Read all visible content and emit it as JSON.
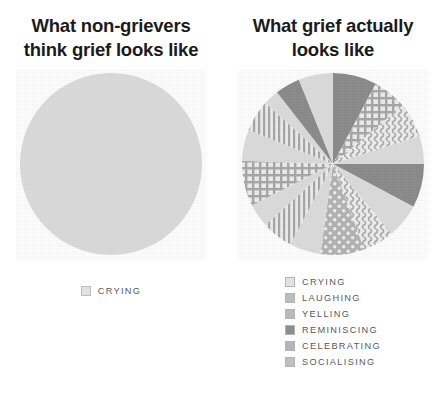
{
  "colors": {
    "background": "#ffffff",
    "title_text": "#1b1b1b",
    "legend_text": "#58595b",
    "light_gray": "#dcdcdc",
    "mid_gray": "#c4c4c4",
    "dark_gray": "#8c8c8c",
    "pattern_gray": "#a8a8a8"
  },
  "left": {
    "title": "What non-grievers think grief looks like",
    "title_line1": "What non-grievers",
    "title_line2": "think grief looks like",
    "legend": [
      {
        "label": "CRYING",
        "pattern": "solid-light",
        "swatch": "crying-swatch"
      }
    ]
  },
  "right": {
    "title": "What grief actually looks like",
    "title_line1": "What grief actually",
    "title_line2": "looks like",
    "legend": [
      {
        "label": "CRYING",
        "pattern": "solid-light",
        "swatch": "crying-swatch"
      },
      {
        "label": "LAUGHING",
        "pattern": "vertical-lines",
        "swatch": "laughing-swatch"
      },
      {
        "label": "YELLING",
        "pattern": "grid",
        "swatch": "yelling-swatch"
      },
      {
        "label": "REMINISCING",
        "pattern": "solid-dark",
        "swatch": "reminiscing-swatch"
      },
      {
        "label": "CELEBRATING",
        "pattern": "dots",
        "swatch": "celebrating-swatch"
      },
      {
        "label": "SOCIALISING",
        "pattern": "wavy",
        "swatch": "socialising-swatch"
      }
    ]
  },
  "chart_data": [
    {
      "type": "pie",
      "title": "What non-grievers think grief looks like",
      "categories": [
        "CRYING"
      ],
      "values": [
        100
      ],
      "unit": "percent",
      "legend_position": "bottom",
      "grid": false
    },
    {
      "type": "pie",
      "title": "What grief actually looks like",
      "categories": [
        "CRYING",
        "LAUGHING",
        "YELLING",
        "REMINISCING",
        "CELEBRATING",
        "SOCIALISING"
      ],
      "values": [
        33.3,
        11.1,
        11.1,
        16.7,
        11.1,
        16.7
      ],
      "unit": "percent",
      "legend_position": "bottom",
      "grid": false,
      "slices": [
        {
          "category": "REMINISCING",
          "pattern": "solid-dark",
          "start_deg": 0,
          "end_deg": 28
        },
        {
          "category": "YELLING",
          "pattern": "grid",
          "start_deg": 28,
          "end_deg": 50
        },
        {
          "category": "SOCIALISING",
          "pattern": "wavy",
          "start_deg": 50,
          "end_deg": 72
        },
        {
          "category": "CRYING",
          "pattern": "solid-light",
          "start_deg": 72,
          "end_deg": 90
        },
        {
          "category": "REMINISCING",
          "pattern": "solid-dark",
          "start_deg": 90,
          "end_deg": 118
        },
        {
          "category": "CRYING",
          "pattern": "solid-light",
          "start_deg": 118,
          "end_deg": 140
        },
        {
          "category": "SOCIALISING",
          "pattern": "wavy",
          "start_deg": 140,
          "end_deg": 160
        },
        {
          "category": "CELEBRATING",
          "pattern": "dots",
          "start_deg": 160,
          "end_deg": 188
        },
        {
          "category": "CRYING",
          "pattern": "solid-light",
          "start_deg": 188,
          "end_deg": 208
        },
        {
          "category": "LAUGHING",
          "pattern": "vertical-lines",
          "start_deg": 208,
          "end_deg": 228
        },
        {
          "category": "CRYING",
          "pattern": "solid-light",
          "start_deg": 228,
          "end_deg": 243
        },
        {
          "category": "YELLING",
          "pattern": "grid",
          "start_deg": 243,
          "end_deg": 272
        },
        {
          "category": "CRYING",
          "pattern": "solid-light",
          "start_deg": 272,
          "end_deg": 292
        },
        {
          "category": "LAUGHING",
          "pattern": "vertical-lines",
          "start_deg": 292,
          "end_deg": 312
        },
        {
          "category": "CRYING",
          "pattern": "solid-light",
          "start_deg": 312,
          "end_deg": 322
        },
        {
          "category": "REMINISCING",
          "pattern": "solid-dark",
          "start_deg": 322,
          "end_deg": 338
        },
        {
          "category": "CRYING",
          "pattern": "solid-light",
          "start_deg": 338,
          "end_deg": 360
        }
      ]
    }
  ]
}
